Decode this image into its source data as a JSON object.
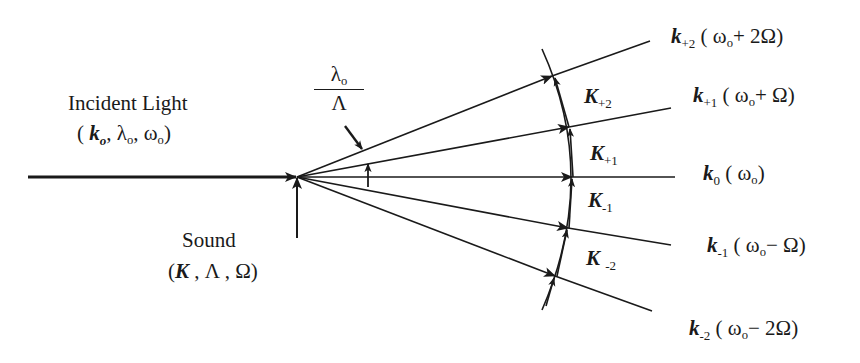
{
  "diagram": {
    "type": "acousto-optic diffraction (Raman-Nath) wave-vector diagram",
    "colors": {
      "line": "#1a1a1a",
      "background": "#ffffff",
      "text": "#1a1a1a"
    },
    "incident": {
      "title": "Incident Light",
      "k": "k",
      "k_sub": "o",
      "lambda": "λ",
      "lambda_sub": "o",
      "omega": "ω",
      "omega_sub": "o",
      "open": "(",
      "close": ")",
      "sep": ","
    },
    "sound": {
      "title": "Sound",
      "K": "K",
      "Lambda": "Λ",
      "Omega": "Ω",
      "open": "(",
      "close": ")",
      "sep": ","
    },
    "angle_label": {
      "numerator": "λ",
      "numerator_sub": "o",
      "denominator": "Λ"
    },
    "sound_vectors": [
      {
        "symbol": "K",
        "sub": "+2"
      },
      {
        "symbol": "K",
        "sub": "+1"
      },
      {
        "symbol": "K",
        "sub": "-1"
      },
      {
        "symbol": "K",
        "sub": "-2"
      }
    ],
    "diffracted_orders": [
      {
        "symbol": "k",
        "sub": "+2",
        "freq": "( ω",
        "freq_sub": "o",
        "shift": "+ 2Ω)"
      },
      {
        "symbol": "k",
        "sub": "+1",
        "freq": "( ω",
        "freq_sub": "o",
        "shift": "+ Ω)"
      },
      {
        "symbol": "k",
        "sub": "0",
        "freq": "( ω",
        "freq_sub": "o",
        "shift": ")"
      },
      {
        "symbol": "k",
        "sub": "-1",
        "freq": "( ω",
        "freq_sub": "o",
        "shift": "− Ω)"
      },
      {
        "symbol": "k",
        "sub": "-2",
        "freq": "( ω",
        "freq_sub": "o",
        "shift": "− 2Ω)"
      }
    ]
  }
}
